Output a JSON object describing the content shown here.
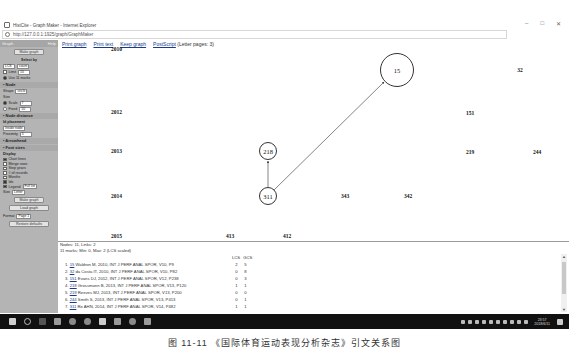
{
  "window": {
    "title": "HistCite - Graph Maker - Internet Explorer",
    "url": "http://127.0.0.1:1925/graph/GraphMaker",
    "controls": [
      "minimize",
      "restore",
      "close"
    ],
    "control_glyphs": [
      "–",
      "□",
      "✕"
    ]
  },
  "toolbar": {
    "links": [
      "Print graph",
      "Print text",
      "Keep graph",
      "PostScript"
    ],
    "note": "(Letter pages: 3)"
  },
  "sidebar": {
    "header_left": "Graph",
    "header_right": "Help",
    "make_graph_top": "Make graph",
    "select_by_title": "Select by",
    "select_by_value": "LCS",
    "select_mode": "count",
    "limit_label": "Limit",
    "limit_value": "10",
    "use_label": "Use 11 marks",
    "node_title": "• Node",
    "shape_label": "Shape",
    "shape_value": "circle",
    "size_label": "Size",
    "scale_label": "Scale",
    "scale_value": "7",
    "fixed_label": "Fixed",
    "fixed_value": "10",
    "node_distance_title": "• Node distance",
    "id_placement_title": "Id placement",
    "id_placement_value": "Inside node",
    "proximity_label": "Proximity",
    "proximity_value": "5",
    "arrowhead_title": "• Arrowhead",
    "font_sizes_title": "• Font sizes",
    "display_title": "Display",
    "display_options": [
      {
        "label": "Chart lines",
        "checked": true
      },
      {
        "label": "Merge rows",
        "checked": false
      },
      {
        "label": "Step years",
        "checked": false
      },
      {
        "label": "# of records",
        "checked": false
      },
      {
        "label": "Months",
        "checked": false
      },
      {
        "label": "Ids",
        "checked": true
      },
      {
        "label": "Legend",
        "checked": true
      }
    ],
    "legend_value": "Full list",
    "size_value": "Letter",
    "make_graph_bottom": "Make graph",
    "load_graph": "Load graph",
    "format_label": "Format",
    "format_value": "Page 1",
    "restore_defaults": "Restore defaults"
  },
  "graph": {
    "years": [
      {
        "label": "2010",
        "y": 0
      },
      {
        "label": "2012",
        "y": 1
      },
      {
        "label": "2013",
        "y": 2
      },
      {
        "label": "2014",
        "y": 3
      },
      {
        "label": "2015",
        "y": 4
      }
    ],
    "nodes": [
      {
        "id": "15",
        "circle": true,
        "x": 339,
        "y": 22,
        "r": 17
      },
      {
        "id": "32",
        "circle": false,
        "x": 462,
        "y": 22
      },
      {
        "id": "151",
        "circle": false,
        "x": 412,
        "y": 65
      },
      {
        "id": "218",
        "circle": true,
        "x": 210,
        "y": 103,
        "r": 9
      },
      {
        "id": "219",
        "circle": false,
        "x": 412,
        "y": 104
      },
      {
        "id": "244",
        "circle": false,
        "x": 479,
        "y": 104
      },
      {
        "id": "311",
        "circle": true,
        "x": 210,
        "y": 148,
        "r": 9
      },
      {
        "id": "343",
        "circle": false,
        "x": 287,
        "y": 148
      },
      {
        "id": "342",
        "circle": false,
        "x": 350,
        "y": 148
      },
      {
        "id": "413",
        "circle": false,
        "x": 172,
        "y": 188
      },
      {
        "id": "412",
        "circle": false,
        "x": 229,
        "y": 188
      }
    ],
    "links": [
      {
        "from": "311",
        "to": "218"
      },
      {
        "from": "311",
        "to": "15"
      }
    ]
  },
  "info": {
    "summary1": "Nodes: 11, Links: 2",
    "summary2": "11 marks; Min: 0, Max: 2 (LCS scaled)",
    "col_lcs": "LCS",
    "col_gcs": "GCS",
    "rows": [
      {
        "n": "1.",
        "id": "15",
        "text": "Waldron M, 2010, INT J PERF ANAL SPOR, V10, P9",
        "lcs": "2",
        "gcs": "5"
      },
      {
        "n": "2.",
        "id": "32",
        "text": "da Costa IT, 2010, INT J PERF ANAL SPOR, V10, P82",
        "lcs": "0",
        "gcs": "8"
      },
      {
        "n": "3.",
        "id": "151",
        "text": "Evans DJ, 2012, INT J PERF ANAL SPOR, V12, P238",
        "lcs": "0",
        "gcs": "3"
      },
      {
        "n": "4.",
        "id": "218",
        "text": "Grossmann B, 2013, INT J PERF ANAL SPOR, V13, P120",
        "lcs": "1",
        "gcs": "1"
      },
      {
        "n": "5.",
        "id": "219",
        "text": "Reeves MJ, 2013, INT J PERF ANAL SPOR, V13, P200",
        "lcs": "0",
        "gcs": "0"
      },
      {
        "n": "6.",
        "id": "244",
        "text": "Smith S, 2013, INT J PERF ANAL SPOR, V13, P413",
        "lcs": "0",
        "gcs": "1"
      },
      {
        "n": "7.",
        "id": "311",
        "text": "Re AHN, 2014, INT J PERF ANAL SPOR, V14, P482",
        "lcs": "1",
        "gcs": "1"
      }
    ]
  },
  "taskbar": {
    "apps": [
      "start",
      "search",
      "task-view",
      "file-explorer",
      "browser-1",
      "browser-2",
      "internet-explorer",
      "app-1",
      "app-2",
      "app-3"
    ],
    "app_colors": [
      "#cfcfcf",
      "#bbbbbb",
      "#555555",
      "#9a9a9a",
      "#8a8a8a",
      "#8a8a8a",
      "#cccccc",
      "#9a9a9a",
      "#8a8a8a",
      "#9a9a9a"
    ],
    "time": "23:57",
    "date": "2018/6/11"
  },
  "caption": "图 11-11  《国际体育运动表现分析杂志》引文关系图"
}
